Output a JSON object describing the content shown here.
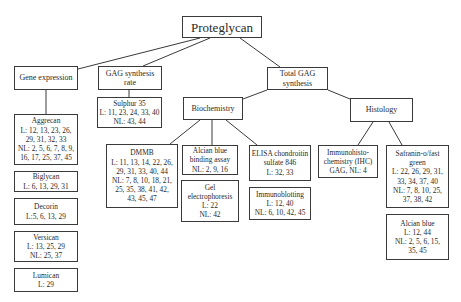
{
  "root": {
    "label": "Proteglycan"
  },
  "gene_expression": {
    "label": "Gene expression",
    "items": [
      {
        "title": "Aggrecan",
        "lines": [
          "L: 12, 13, 23, 26,",
          "29, 31, 32, 33",
          "NL: 2, 5, 6, 7, 8, 9,",
          "16, 17, 25, 37, 45"
        ]
      },
      {
        "title": "Biglycan",
        "lines": [
          "L: 6, 13, 29, 31"
        ]
      },
      {
        "title": "Decorin",
        "lines": [
          "L:5, 6, 13, 29"
        ]
      },
      {
        "title": "Versican",
        "lines": [
          "L: 13, 25, 29",
          "NL: 25, 37"
        ]
      },
      {
        "title": "Lumican",
        "lines": [
          "L: 29"
        ]
      }
    ]
  },
  "gag_synthesis_rate": {
    "label_line1": "GAG synthesis",
    "label_line2": "rate",
    "sulphur": {
      "title": "Sulphur 35",
      "lines": [
        "L: 11, 23, 24, 33, 40",
        "NL: 43, 44"
      ]
    }
  },
  "total_gag": {
    "label_line1": "Total GAG",
    "label_line2": "synthesis",
    "biochemistry": {
      "label": "Biochemistry",
      "dmmb": {
        "title": "DMMB",
        "lines": [
          "L: 11, 13, 14, 22, 26,",
          "29, 31, 33, 40, 44",
          "NL: 7, 8, 10, 18, 21,",
          "25, 35, 38, 41, 42,",
          "43, 45, 47"
        ]
      },
      "alcian_binding": {
        "lines": [
          "Alcian blue",
          "binding assay",
          "NL: 2, 9, 16"
        ]
      },
      "gel": {
        "lines": [
          "Gel",
          "electrophoresis",
          "L: 22",
          "NL: 42"
        ]
      },
      "elisa": {
        "lines": [
          "ELISA chondroitin",
          "sulfate 846",
          "L: 32, 33"
        ]
      },
      "immunoblotting": {
        "lines": [
          "Immunoblotting",
          "L: 12, 40",
          "NL: 6, 10, 42, 45"
        ]
      }
    },
    "histology": {
      "label": "Histology",
      "ihc": {
        "lines": [
          "Immunohisto-",
          "chemistry (IHC)",
          "GAG, NL: 4"
        ]
      },
      "safranin": {
        "lines": [
          "Safranin-o/fast",
          "green",
          "L: 22, 26, 29, 31,",
          "33, 34, 37, 40",
          "NL: 7, 8, 10, 25,",
          "37, 38, 42"
        ]
      },
      "alcian_blue": {
        "lines": [
          "Alcian blue",
          "L: 12, 44",
          "NL: 2, 5, 6, 15,",
          "35, 45"
        ]
      }
    }
  }
}
